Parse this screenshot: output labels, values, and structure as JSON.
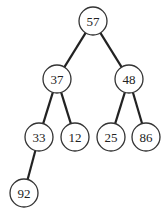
{
  "diagram": {
    "type": "binary-tree",
    "nodes": [
      {
        "id": "n57",
        "label": "57",
        "x": 93,
        "y": 21
      },
      {
        "id": "n37",
        "label": "37",
        "x": 57,
        "y": 79
      },
      {
        "id": "n48",
        "label": "48",
        "x": 129,
        "y": 79
      },
      {
        "id": "n33",
        "label": "33",
        "x": 39,
        "y": 137
      },
      {
        "id": "n12",
        "label": "12",
        "x": 75,
        "y": 137
      },
      {
        "id": "n25",
        "label": "25",
        "x": 111,
        "y": 137
      },
      {
        "id": "n86",
        "label": "86",
        "x": 146,
        "y": 137
      },
      {
        "id": "n92",
        "label": "92",
        "x": 24,
        "y": 193
      }
    ],
    "edges": [
      [
        "n57",
        "n37"
      ],
      [
        "n57",
        "n48"
      ],
      [
        "n37",
        "n33"
      ],
      [
        "n37",
        "n12"
      ],
      [
        "n48",
        "n25"
      ],
      [
        "n48",
        "n86"
      ],
      [
        "n33",
        "n92"
      ]
    ],
    "node_radius": 14
  }
}
